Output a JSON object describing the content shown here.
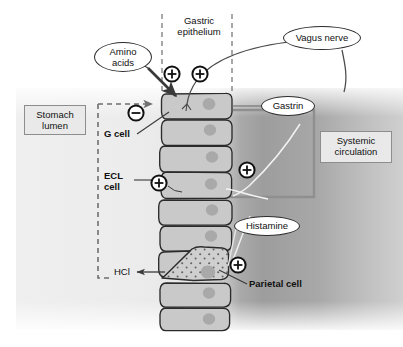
{
  "figure": {
    "type": "biological-schematic"
  },
  "regions": {
    "gastric_epithelium_label": "Gastric\nepithelium",
    "gastric_epithelium_line1": "Gastric",
    "gastric_epithelium_line2": "epithelium",
    "stomach_lumen_line1": "Stomach",
    "stomach_lumen_line2": "lumen",
    "systemic_circulation_line1": "Systemic",
    "systemic_circulation_line2": "circulation"
  },
  "callouts": {
    "amino_acids_line1": "Amino",
    "amino_acids_line2": "acids",
    "vagus_nerve": "Vagus nerve",
    "gastrin": "Gastrin",
    "histamine": "Histamine"
  },
  "cell_labels": {
    "g_cell": "G cell",
    "ecl_cell_line1": "ECL",
    "ecl_cell_line2": "cell",
    "parietal_cell": "Parietal cell"
  },
  "secretion": {
    "hcl": "HCl"
  },
  "signs": [
    {
      "id": "plus-vagus-g-cell",
      "glyph": "+",
      "x": 172,
      "y": 74
    },
    {
      "id": "plus-vagus-epithelium",
      "glyph": "+",
      "x": 200,
      "y": 74
    },
    {
      "id": "minus-somatostatin-g-cell",
      "glyph": "−",
      "x": 136,
      "y": 113
    },
    {
      "id": "plus-gastrin-ecl",
      "glyph": "+",
      "x": 247,
      "y": 170
    },
    {
      "id": "plus-ecl-cell",
      "glyph": "+",
      "x": 159,
      "y": 183
    },
    {
      "id": "plus-parietal-cell",
      "glyph": "+",
      "x": 238,
      "y": 265
    }
  ],
  "colors": {
    "cell_fill": "#c9c9c9",
    "cell_stroke": "#2b2b2b",
    "nucleus": "#a6a6a6",
    "tissue_light": "#ededed",
    "tissue_dark": "#9a9a9a",
    "box_fill": "#e9e9e9",
    "box_stroke": "#8d8d8d",
    "dashed_line": "#6f6f6f",
    "vessel_stroke": "#8a8a8a",
    "text": "#111111",
    "background": "#ffffff"
  },
  "boundaries": {
    "epithelium_left_dash_x": 162,
    "epithelium_right_dash_x": 232,
    "tissue_top_y": 88,
    "tissue_bottom_y": 330
  }
}
